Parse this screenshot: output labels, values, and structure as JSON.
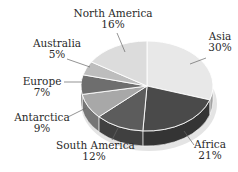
{
  "chart_data": {
    "type": "pie",
    "style": "3d-tilted",
    "title": "",
    "start_angle_deg": 0,
    "direction": "clockwise",
    "slices": [
      {
        "label": "Asia",
        "value": 30,
        "pct_label": "30%",
        "color": "#e8e8e8"
      },
      {
        "label": "Africa",
        "value": 21,
        "pct_label": "21%",
        "color": "#4a4a4a"
      },
      {
        "label": "South America",
        "value": 12,
        "pct_label": "12%",
        "color": "#5c5c5c"
      },
      {
        "label": "Antarctica",
        "value": 9,
        "pct_label": "9%",
        "color": "#a8a8a8"
      },
      {
        "label": "Europe",
        "value": 7,
        "pct_label": "7%",
        "color": "#6e6e6e"
      },
      {
        "label": "Australia",
        "value": 5,
        "pct_label": "5%",
        "color": "#bdbdbd"
      },
      {
        "label": "North America",
        "value": 16,
        "pct_label": "16%",
        "color": "#dcdcdc"
      }
    ],
    "legend": "none (callout labels)"
  }
}
